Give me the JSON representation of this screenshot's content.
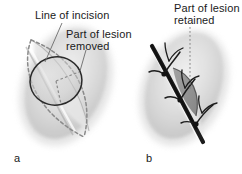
{
  "figure": {
    "type": "medical-illustration",
    "background_color": "#ffffff",
    "panels": [
      {
        "id": "a",
        "letter": "a",
        "description": "Lens-shaped (elliptical) line of incision drawn around a circular lesion before excision",
        "annotations": [
          "Line of incision",
          "Part of lesion removed"
        ]
      },
      {
        "id": "b",
        "letter": "b",
        "description": "Wound closed with three interrupted sutures, part of the lesion remaining",
        "annotations": [
          "Part of lesion retained"
        ]
      }
    ]
  },
  "labels": {
    "line_of_incision": "Line of incision",
    "part_of_lesion_removed": "Part of lesion\nremoved",
    "part_of_lesion_retained": "Part of lesion\nretained",
    "panel_a_letter": "a",
    "panel_b_letter": "b"
  },
  "colors": {
    "text": "#1a1a1a",
    "skin_fill": "#d8d8d8",
    "skin_shadow": "#bdbdbd",
    "skin_highlight": "#efefef",
    "lesion_outline": "#2a2a2a",
    "lesion_fill": "#cccccc",
    "incision_dashes": "#8a8a8a",
    "suture_thread": "#1c1c1c",
    "retained_lesion_fill": "#8d8d8d",
    "leader_line": "#6b6b6b",
    "background": "#ffffff"
  },
  "graphics": {
    "panel_a": {
      "tissue_shape": "soft grey ovoid blob tilted about 25 degrees",
      "incision_outline": "dashed lens / ellipse shape, pointed at both ends",
      "lesion": "solid-outlined circle centered on the incision ellipse",
      "radius_ticks": "two short dashed radii inside the lesion circle"
    },
    "panel_b": {
      "tissue_shape": "soft grey ovoid blob tilted about 25 degrees",
      "wound_line": "dark closed incision running diagonally from upper-left to lower-right",
      "suture_count": 3,
      "suture_description": "interrupted sutures with knots and cut thread tails",
      "retained_lesion": "dark grey crescent of lesion remaining beside the closed wound"
    }
  }
}
